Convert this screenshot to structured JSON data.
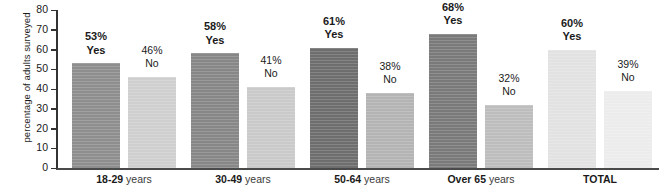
{
  "chart_data": {
    "type": "bar",
    "title": "",
    "subtitle": "",
    "xlabel": "",
    "ylabel": "percentage of adults surveyed",
    "ylim": [
      0,
      80
    ],
    "ytick_step": 10,
    "ytick_labels": [
      "80",
      "70",
      "60",
      "50",
      "40",
      "30",
      "20",
      "10",
      "0"
    ],
    "ytick_values": [
      80,
      70,
      60,
      50,
      40,
      30,
      20,
      10,
      0
    ],
    "grid": false,
    "legend": "none",
    "categories": [
      "18-29 years",
      "30-49 years",
      "50-64 years",
      "Over 65 years",
      "TOTAL"
    ],
    "series": [
      {
        "name": "Yes",
        "values": [
          53,
          58,
          61,
          68,
          60
        ]
      },
      {
        "name": "No",
        "values": [
          46,
          41,
          38,
          32,
          39
        ]
      }
    ],
    "annotations": [
      "53% Yes",
      "46% No",
      "58% Yes",
      "41% No",
      "61% Yes",
      "38% No",
      "68% Yes",
      "32% No",
      "60% Yes",
      "39% No"
    ]
  },
  "axis": {
    "y_title": "percentage of adults surveyed",
    "ticks": [
      {
        "label": "80",
        "value": 80
      },
      {
        "label": "70",
        "value": 70
      },
      {
        "label": "60",
        "value": 60
      },
      {
        "label": "50",
        "value": 50
      },
      {
        "label": "40",
        "value": 40
      },
      {
        "label": "30",
        "value": 30
      },
      {
        "label": "20",
        "value": 20
      },
      {
        "label": "10",
        "value": 10
      },
      {
        "label": "0",
        "value": 0
      }
    ]
  },
  "groups": [
    {
      "id": "18-29",
      "cat_main": "18-29",
      "cat_sub": " years",
      "bars": [
        {
          "answer": "Yes",
          "pct_label": "53%",
          "value": 53,
          "color": "#8e8e8e"
        },
        {
          "answer": "No",
          "pct_label": "46%",
          "value": 46,
          "color": "#cfcfcf"
        }
      ]
    },
    {
      "id": "30-49",
      "cat_main": "30-49",
      "cat_sub": " years",
      "bars": [
        {
          "answer": "Yes",
          "pct_label": "58%",
          "value": 58,
          "color": "#878787"
        },
        {
          "answer": "No",
          "pct_label": "41%",
          "value": 41,
          "color": "#cacaca"
        }
      ]
    },
    {
      "id": "50-64",
      "cat_main": "50-64",
      "cat_sub": " years",
      "bars": [
        {
          "answer": "Yes",
          "pct_label": "61%",
          "value": 61,
          "color": "#6e6e6e"
        },
        {
          "answer": "No",
          "pct_label": "38%",
          "value": 38,
          "color": "#b4b4b4"
        }
      ]
    },
    {
      "id": "over-65",
      "cat_main": "Over 65",
      "cat_sub": " years",
      "bars": [
        {
          "answer": "Yes",
          "pct_label": "68%",
          "value": 68,
          "color": "#7a7a7a"
        },
        {
          "answer": "No",
          "pct_label": "32%",
          "value": 32,
          "color": "#bdbdbd"
        }
      ]
    },
    {
      "id": "total",
      "cat_main": "TOTAL",
      "cat_sub": "",
      "bars": [
        {
          "answer": "Yes",
          "pct_label": "60%",
          "value": 60,
          "color": "#e2e2e2"
        },
        {
          "answer": "No",
          "pct_label": "39%",
          "value": 39,
          "color": "#ececec"
        }
      ]
    }
  ],
  "colors": {
    "background": "#ffffff",
    "axis": "#333333",
    "text": "#1a1a1a"
  }
}
